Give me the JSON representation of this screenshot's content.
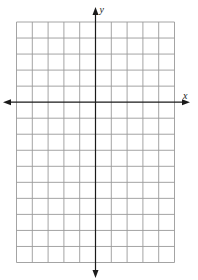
{
  "figure": {
    "type": "coordinate-plane",
    "grid": {
      "columns": 10,
      "rows": 15,
      "columns_left_of_y_axis": 5,
      "columns_right_of_y_axis": 5,
      "rows_above_x_axis": 5,
      "rows_below_x_axis": 10
    },
    "axes": {
      "x_label": "x",
      "y_label": "y",
      "x_arrows": [
        "left",
        "right"
      ],
      "y_arrows": [
        "up",
        "down"
      ]
    },
    "colors": {
      "grid": "#9a9a9a",
      "axis": "#1a1a1a",
      "background": "#ffffff"
    }
  }
}
